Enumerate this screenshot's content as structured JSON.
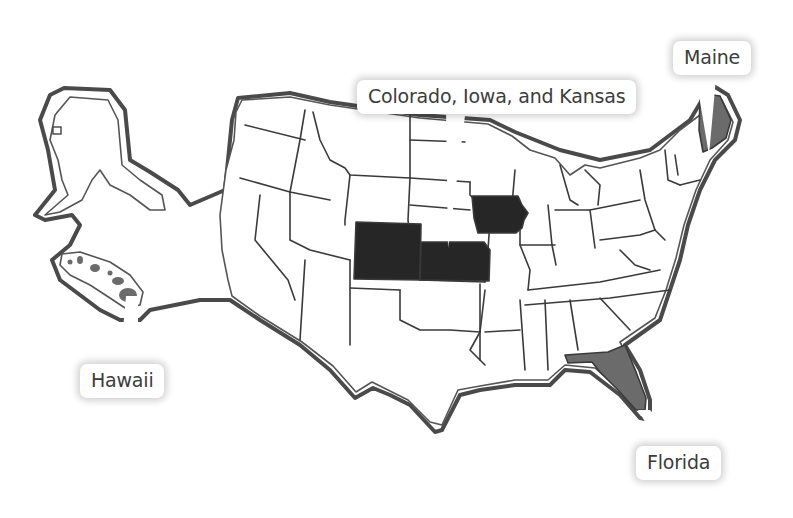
{
  "map": {
    "title": "United States map with highlighted states",
    "colors": {
      "outline": "#4a4a4a",
      "highlight_dark": "#262626",
      "highlight_gray": "#6b6b6b",
      "background": "#ffffff",
      "label_text": "#3c3c3c"
    },
    "highlighted_states": [
      {
        "name": "Colorado",
        "fill": "dark"
      },
      {
        "name": "Iowa",
        "fill": "dark"
      },
      {
        "name": "Kansas",
        "fill": "dark"
      },
      {
        "name": "Maine",
        "fill": "gray"
      },
      {
        "name": "Florida",
        "fill": "gray"
      },
      {
        "name": "Hawaii",
        "fill": "gray"
      }
    ]
  },
  "callouts": {
    "central": {
      "label": "Colorado, Iowa, and Kansas"
    },
    "maine": {
      "label": "Maine"
    },
    "hawaii": {
      "label": "Hawaii"
    },
    "florida": {
      "label": "Florida"
    }
  }
}
